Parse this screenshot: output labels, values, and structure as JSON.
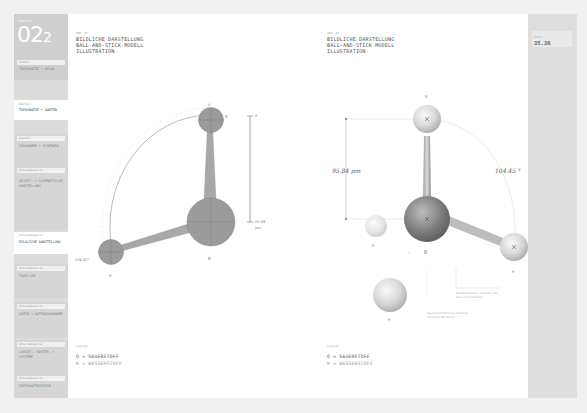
{
  "sidebar": {
    "logo": {
      "small_label": "kapitel",
      "number": "02",
      "sub": "2"
    },
    "sections": [
      {
        "head": "Inhalt",
        "items": [
          "TOPOGRAFIE + ATLAS"
        ]
      },
      {
        "head": "Kapitel",
        "items": [
          "TOPOGRAFIE + KARTEN"
        ]
      },
      {
        "head": "Kapitel",
        "items": [
          "DIAGRAMME + SCHEMATA"
        ]
      },
      {
        "head": "Unterkategorie",
        "items": [
          "OBJEKT- + SCHEMATISCHE DARSTELLUNG"
        ]
      },
      {
        "head": "Unterkategorie",
        "items": [
          "BILDLICHE DARSTELLUNG"
        ],
        "active": true
      },
      {
        "head": "Unterkategorie",
        "items": [
          "TABELLEN"
        ]
      },
      {
        "head": "Unterkategorie",
        "items": [
          "DATEN + DATENDIAGRAMME"
        ]
      },
      {
        "head": "Unterkategorie",
        "items": [
          "LAYOUT-, RASTER- + SYSTEME"
        ]
      },
      {
        "head": "Unterkategorie",
        "items": [
          "INFOGRAFIKDESIGN"
        ]
      }
    ]
  },
  "panels": [
    {
      "small_label": "ABB. 01",
      "title_lines": [
        "BILDLICHE DARSTELLUNG",
        "BALL-AND-STICK-MODELL",
        "ILLUSTRATION"
      ],
      "diagram": {
        "style": "flat-wireframe",
        "labels": {
          "top_h": "H",
          "left_h": "H",
          "o": "O",
          "delta": "δ⁺"
        },
        "bond_length": "95.84",
        "bond_unit": "pm",
        "angle": "104.45°",
        "dimension_top": "δ"
      },
      "legend": {
        "small_label": "Legende",
        "lines": [
          "O = SAUERSTOFF",
          "H = WASSERSTOFF"
        ]
      }
    },
    {
      "small_label": "ABB. 02",
      "title_lines": [
        "BILDLICHE DARSTELLUNG",
        "BALL-AND-STICK-MODELL",
        "ILLUSTRATION"
      ],
      "diagram": {
        "style": "shaded-3d",
        "labels": {
          "top_h": "H",
          "left_h": "H",
          "right_h": "H",
          "o": "O",
          "bottom_h": "H",
          "plus": "+"
        },
        "bond_length": "95.84 pm",
        "angle": "104.45 °",
        "note_1": [
          "Bindungswinkel zwischen den",
          "Wasserstoffatomen"
        ],
        "note_2": [
          "Wasserstoffbrücken-Bindung",
          "zwischen Molekülen"
        ]
      },
      "legend": {
        "small_label": "Legende",
        "lines": [
          "O = SAUERSTOFF",
          "H = WASSERSTOFF"
        ]
      }
    }
  ],
  "rightbar": {
    "label": "Seite",
    "page": "35.36"
  },
  "colors": {
    "atom_flat": "#9a9a9a",
    "paper": "#ffffff",
    "frame": "#e6e6e6",
    "sidebar": "#dcdcdc"
  }
}
